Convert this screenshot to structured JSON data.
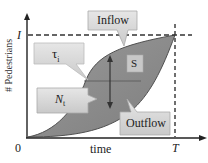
{
  "diagram": {
    "axes": {
      "y_label": "# Pedestrians",
      "x_label": "time",
      "origin_label": "0",
      "y_max_label": "I",
      "x_max_label": "T"
    },
    "callouts": {
      "inflow": "Inflow",
      "outflow": "Outflow",
      "tau": "τ",
      "tau_sub": "i",
      "n": "N",
      "n_sub": "t",
      "s": "S"
    },
    "colors": {
      "region_fill": "#8c8c8c",
      "region_stroke": "#555555",
      "callout_fill": "#d9d9d9",
      "callout_stroke": "#b0b0b0",
      "axis": "#222222"
    }
  }
}
